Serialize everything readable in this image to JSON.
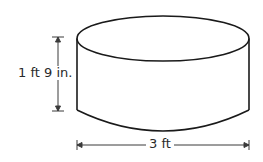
{
  "figure": {
    "shape": "cylinder",
    "height_label": "1 ft 9 in.",
    "diameter_label": "3 ft",
    "stroke_color": "#1a1a1a",
    "dimension_color": "#3a3a3a"
  }
}
